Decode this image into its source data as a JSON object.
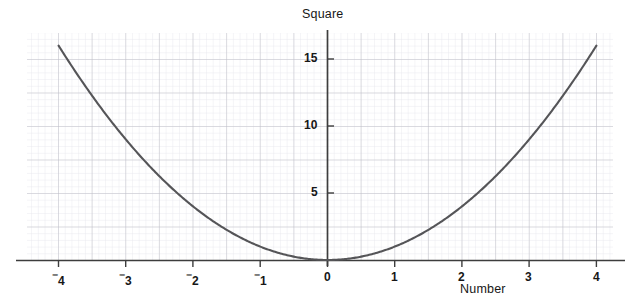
{
  "chart_data": {
    "type": "line",
    "title": "Square",
    "xlabel": "Number",
    "ylabel": "",
    "function": "y = x^2",
    "xlim": [
      -4.35,
      4.25
    ],
    "ylim": [
      -0.55,
      17.0
    ],
    "grid": true,
    "minor_grid": true,
    "legend": "none",
    "x_ticks": [
      -4,
      -3,
      -2,
      -1,
      0,
      1,
      2,
      3,
      4
    ],
    "x_tick_labels": [
      "⁻4",
      "⁻3",
      "⁻2",
      "⁻1",
      "0",
      "1",
      "2",
      "3",
      "4"
    ],
    "y_ticks": [
      5,
      10,
      15
    ],
    "y_tick_labels": [
      "5",
      "10",
      "15"
    ],
    "x": [
      -4,
      -3.5,
      -3,
      -2.5,
      -2,
      -1.5,
      -1,
      -0.5,
      0,
      0.5,
      1,
      1.5,
      2,
      2.5,
      3,
      3.5,
      4
    ],
    "values": [
      16,
      12.25,
      9,
      6.25,
      4,
      2.25,
      1,
      0.25,
      0,
      0.25,
      1,
      2.25,
      4,
      6.25,
      9,
      12.25,
      16
    ],
    "series": [
      {
        "name": "Square",
        "x": [
          -4,
          -3.5,
          -3,
          -2.5,
          -2,
          -1.5,
          -1,
          -0.5,
          0,
          0.5,
          1,
          1.5,
          2,
          2.5,
          3,
          3.5,
          4
        ],
        "values": [
          16,
          12.25,
          9,
          6.25,
          4,
          2.25,
          1,
          0.25,
          0,
          0.25,
          1,
          2.25,
          4,
          6.25,
          9,
          12.25,
          16
        ]
      }
    ],
    "colors": {
      "curve": "#555555",
      "axis": "#3a3a3a",
      "major_grid": "#b8b8c2",
      "minor_grid": "#e2e2e8",
      "text": "#171717",
      "background": "#ffffff"
    }
  },
  "labels": {
    "title": "Square",
    "xlabel": "Number",
    "y15": "15",
    "y10": "10",
    "y5": "5",
    "xm4": "4",
    "xm3": "3",
    "xm2": "2",
    "xm1": "1",
    "x0": "0",
    "x1": "1",
    "x2": "2",
    "x3": "3",
    "x4": "4",
    "minus": "⁻"
  }
}
